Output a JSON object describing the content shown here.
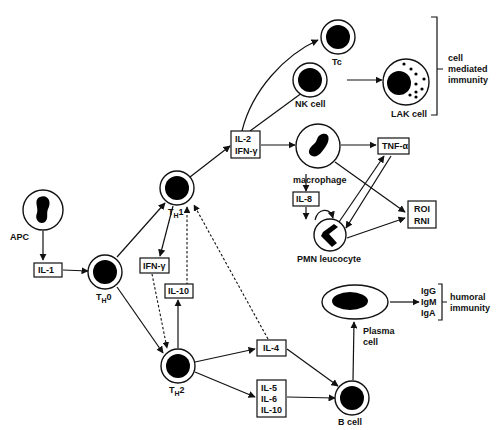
{
  "diagram": {
    "nodes": {
      "apc": {
        "label": "APC"
      },
      "th0": {
        "label": "T",
        "sub": "H",
        "suffix": "0"
      },
      "th1": {
        "label": "T",
        "sub": "H",
        "suffix": "1"
      },
      "th2": {
        "label": "T",
        "sub": "H",
        "suffix": "2"
      },
      "tc": {
        "label": "Tc"
      },
      "nk": {
        "label": "NK cell"
      },
      "lak": {
        "label": "LAK cell"
      },
      "macrophage": {
        "label": "macrophage"
      },
      "pmn": {
        "label": "PMN leucocyte"
      },
      "bcell": {
        "label": "B cell"
      },
      "plasma": {
        "label1": "Plasma",
        "label2": "cell"
      }
    },
    "boxes": {
      "il1": [
        "IL-1"
      ],
      "il2_ifn": [
        "IL-2",
        "IFN-γ"
      ],
      "ifn_g": [
        "IFN-γ"
      ],
      "il10": [
        "IL-10"
      ],
      "il4": [
        "IL-4"
      ],
      "il5_6_10": [
        "IL-5",
        "IL-6",
        "IL-10"
      ],
      "tnf": [
        "TNF-α"
      ],
      "il8": [
        "IL-8"
      ],
      "roi_rni": [
        "ROI",
        "RNI"
      ]
    },
    "antibodies": [
      "IgG",
      "IgM",
      "IgA"
    ],
    "brackets": {
      "cell_mediated": [
        "cell",
        "mediated",
        "immunity"
      ],
      "humoral": [
        "humoral",
        "immunity"
      ]
    }
  }
}
